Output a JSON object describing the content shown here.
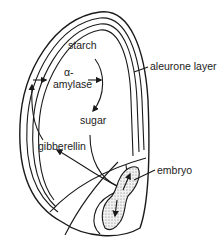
{
  "diagram": {
    "type": "seed germination (cereal grain cross-section)",
    "labels": {
      "starch": "starch",
      "alpha": "α-",
      "amylase": "amylase",
      "sugar": "sugar",
      "gibberellin": "gibberellin",
      "aleurone_layer": "aleurone layer",
      "embryo": "embryo"
    },
    "flows": [
      {
        "from": "embryo",
        "to": "aleurone layer",
        "via": "gibberellin"
      },
      {
        "from": "aleurone layer",
        "to": "starch",
        "via": "α-amylase"
      },
      {
        "from": "starch",
        "to": "sugar"
      },
      {
        "from": "sugar",
        "to": "embryo"
      }
    ],
    "colors": {
      "line": "#1a1a1a",
      "embryo_fill": "#d8d8d8",
      "background": "#ffffff"
    }
  }
}
